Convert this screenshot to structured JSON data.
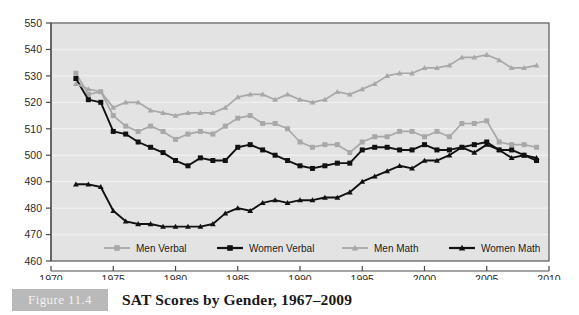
{
  "caption": {
    "figure_tag": "Figure 11.4",
    "title": "SAT Scores by Gender, 1967–2009"
  },
  "colors": {
    "plot_background": "#e3e3e3",
    "page_background": "#ffffff",
    "gridline": "#f0f0f0",
    "axis": "#4a4a4a",
    "men_series": "#a8a8a8",
    "women_series": "#111111",
    "figure_tag_background": "#b9b9b9",
    "figure_tag_text": "#f2f2f2"
  },
  "axes": {
    "y": {
      "min": 460,
      "max": 550,
      "step": 10,
      "ticks": [
        460,
        470,
        480,
        490,
        500,
        510,
        520,
        530,
        540,
        550
      ]
    },
    "x": {
      "min": 1970,
      "max": 2010,
      "step": 5,
      "ticks": [
        1970,
        1975,
        1980,
        1985,
        1990,
        1995,
        2000,
        2005,
        2010
      ]
    }
  },
  "legend": {
    "position": "bottom-inside",
    "entries": [
      {
        "label": "Men Verbal",
        "color": "#a8a8a8",
        "marker": "square"
      },
      {
        "label": "Women Verbal",
        "color": "#111111",
        "marker": "square"
      },
      {
        "label": "Men Math",
        "color": "#a8a8a8",
        "marker": "triangle"
      },
      {
        "label": "Women Math",
        "color": "#111111",
        "marker": "triangle"
      }
    ]
  },
  "chart_data": {
    "type": "line",
    "title": "SAT Scores by Gender, 1967–2009",
    "xlabel": "",
    "ylabel": "",
    "xlim": [
      1970,
      2010
    ],
    "ylim": [
      460,
      550
    ],
    "grid": true,
    "legend_position": "bottom-inside",
    "x": [
      1972,
      1973,
      1974,
      1975,
      1976,
      1977,
      1978,
      1979,
      1980,
      1981,
      1982,
      1983,
      1984,
      1985,
      1986,
      1987,
      1988,
      1989,
      1990,
      1991,
      1992,
      1993,
      1994,
      1995,
      1996,
      1997,
      1998,
      1999,
      2000,
      2001,
      2002,
      2003,
      2004,
      2005,
      2006,
      2007,
      2008,
      2009
    ],
    "series": [
      {
        "name": "Men Verbal",
        "color": "#a8a8a8",
        "marker": "square",
        "values": [
          531,
          523,
          524,
          515,
          511,
          509,
          511,
          509,
          506,
          508,
          509,
          508,
          511,
          514,
          515,
          512,
          512,
          510,
          505,
          503,
          504,
          504,
          501,
          505,
          507,
          507,
          509,
          509,
          507,
          509,
          507,
          512,
          512,
          513,
          505,
          504,
          504,
          503
        ]
      },
      {
        "name": "Women Verbal",
        "color": "#111111",
        "marker": "square",
        "values": [
          529,
          521,
          520,
          509,
          508,
          505,
          503,
          501,
          498,
          496,
          499,
          498,
          498,
          503,
          504,
          502,
          500,
          498,
          496,
          495,
          496,
          497,
          497,
          502,
          503,
          503,
          502,
          502,
          504,
          502,
          502,
          503,
          504,
          505,
          502,
          502,
          500,
          498
        ]
      },
      {
        "name": "Men Math",
        "color": "#a8a8a8",
        "marker": "triangle",
        "values": [
          527,
          525,
          524,
          518,
          520,
          520,
          517,
          516,
          515,
          516,
          516,
          516,
          518,
          522,
          523,
          523,
          521,
          523,
          521,
          520,
          521,
          524,
          523,
          525,
          527,
          530,
          531,
          531,
          533,
          533,
          534,
          537,
          537,
          538,
          536,
          533,
          533,
          534
        ]
      },
      {
        "name": "Women Math",
        "color": "#111111",
        "marker": "triangle",
        "values": [
          489,
          489,
          488,
          479,
          475,
          474,
          474,
          473,
          473,
          473,
          473,
          474,
          478,
          480,
          479,
          482,
          483,
          482,
          483,
          483,
          484,
          484,
          486,
          490,
          492,
          494,
          496,
          495,
          498,
          498,
          500,
          503,
          501,
          504,
          502,
          499,
          500,
          499
        ]
      }
    ]
  }
}
